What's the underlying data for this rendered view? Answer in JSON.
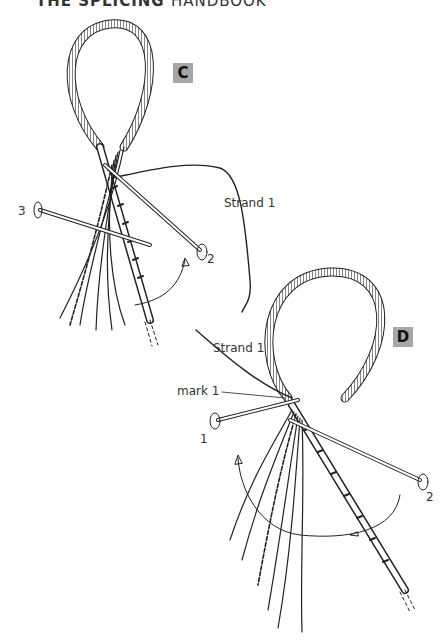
{
  "page": {
    "running_head_bold": "THE SPLICING",
    "running_head_light": "HANDBOOK"
  },
  "figure_c": {
    "badge": "C",
    "labels": {
      "strand": "Strand 1",
      "fid_3": "3",
      "fid_2": "2"
    }
  },
  "figure_d": {
    "badge": "D",
    "labels": {
      "strand": "Strand 1",
      "mark": "mark 1",
      "fid_1": "1",
      "fid_2": "2"
    }
  },
  "colors": {
    "badge_bg": "#a6a6a6",
    "line": "#222222"
  }
}
